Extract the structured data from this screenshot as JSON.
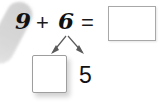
{
  "equation": {
    "first_addend": "9",
    "operator": "+",
    "second_addend": "6",
    "equals": "=",
    "answer": "",
    "answer_placeholder": ""
  },
  "decomposition": {
    "unknown_part": "",
    "unknown_part_placeholder": "",
    "known_part": "5"
  },
  "colors": {
    "text": "#111111",
    "box_border": "#a8a8a8",
    "part_box_border": "#9e9e9e",
    "arrow": "#5a5a5a",
    "smudge": "#d2d2d2",
    "background": "#ffffff"
  },
  "icons": {
    "branch_left": "arrow-down-left-icon",
    "branch_right": "arrow-down-right-icon",
    "smudge": "gray-smudge-shadow-icon"
  }
}
